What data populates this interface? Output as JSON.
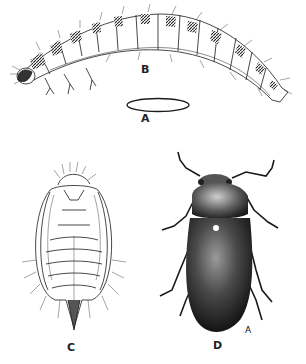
{
  "figure": {
    "panels": [
      {
        "id": "A",
        "label": "A",
        "subject": "egg"
      },
      {
        "id": "B",
        "label": "B",
        "subject": "larva"
      },
      {
        "id": "C",
        "label": "C",
        "subject": "pupa"
      },
      {
        "id": "D",
        "label": "D",
        "subject": "adult beetle"
      }
    ],
    "artist_mark": "A"
  },
  "colors": {
    "ink": "#1a1a1a",
    "background": "#ffffff"
  }
}
